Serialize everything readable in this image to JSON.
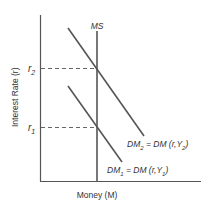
{
  "diagram": {
    "type": "money-market-supply-demand",
    "axes": {
      "y_label": "Interest Rate (r)",
      "x_label": "Money (M)"
    },
    "ticks": {
      "r2": {
        "label": "r",
        "sub": "2"
      },
      "r1": {
        "label": "r",
        "sub": "1"
      }
    },
    "curves": {
      "ms": {
        "label": "MS"
      },
      "dm2": {
        "label_main": "DM",
        "label_sub": "2",
        "label_eq": " = DM (r,Y",
        "label_sub2": "2",
        "label_end": ")"
      },
      "dm1": {
        "label_main": "DM",
        "label_sub": "1",
        "label_eq": " = DM (r,Y",
        "label_sub2": "1",
        "label_end": ")"
      }
    },
    "colors": {
      "line": "#555555",
      "text": "#333333",
      "background": "#ffffff"
    }
  }
}
